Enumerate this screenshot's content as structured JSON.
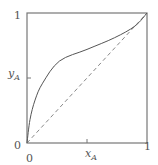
{
  "chart_data": {
    "type": "line",
    "title": "",
    "xlabel": "x",
    "xlabel_sub": "A",
    "ylabel": "y",
    "ylabel_sub": "A",
    "xlim": [
      0,
      1
    ],
    "ylim": [
      0,
      1
    ],
    "x_ticks": [
      "0",
      "1"
    ],
    "y_ticks": [
      "0",
      "1"
    ],
    "grid": false,
    "legend": null,
    "series": [
      {
        "name": "equilibrium curve",
        "style": "solid",
        "x": [
          0.0,
          0.025,
          0.067,
          0.13,
          0.27,
          0.5,
          0.73,
          0.9,
          1.0
        ],
        "y": [
          0.0,
          0.18,
          0.33,
          0.46,
          0.63,
          0.72,
          0.81,
          0.9,
          1.0
        ]
      },
      {
        "name": "diagonal y = x",
        "style": "dashed",
        "x": [
          0,
          1
        ],
        "y": [
          0,
          1
        ]
      }
    ]
  },
  "labels": {
    "y_top_tick": "1",
    "y_bottom_tick": "0",
    "x_left_tick": "0",
    "x_right_tick": "1",
    "x_axis_main": "x",
    "x_axis_sub": "A",
    "y_axis_main": "y",
    "y_axis_sub": "A"
  },
  "colors": {
    "axis": "#777777",
    "curve": "#555555",
    "diagonal": "#888888"
  }
}
